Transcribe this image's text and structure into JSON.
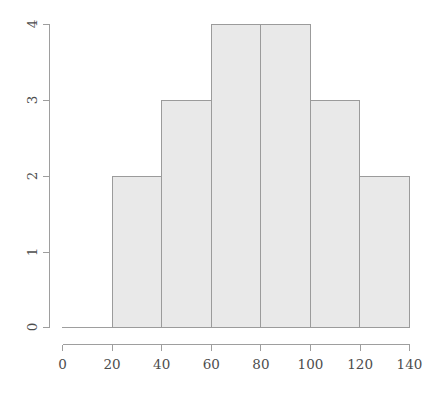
{
  "figure": {
    "name": "histogram-figure",
    "background_color": "#ffffff",
    "width": 438,
    "height": 399
  },
  "chart_data": {
    "type": "bar",
    "subtype": "histogram",
    "title": "",
    "subtitle": "",
    "xlabel": "",
    "ylabel": "",
    "categories": [
      "20-40",
      "40-60",
      "60-80",
      "80-100",
      "100-120",
      "120-140"
    ],
    "bin_edges": [
      20,
      40,
      60,
      80,
      100,
      120,
      140
    ],
    "bin_width": 20,
    "values": [
      2,
      3,
      4,
      4,
      3,
      2
    ],
    "x": [
      30,
      50,
      70,
      90,
      110,
      130
    ],
    "xlim": [
      0,
      140
    ],
    "ylim": [
      0,
      4
    ],
    "xticks": [
      0,
      20,
      40,
      60,
      80,
      100,
      120,
      140
    ],
    "xtick_labels": [
      "0",
      "20",
      "40",
      "60",
      "80",
      "100",
      "120",
      "140"
    ],
    "yticks": [
      0,
      1,
      2,
      3,
      4
    ],
    "ytick_labels": [
      "0",
      "1",
      "2",
      "3",
      "4"
    ],
    "grid": false,
    "legend": false,
    "legend_position": "none",
    "bar_fill_color": "#e9e9e9",
    "bar_border_color": "#9b9b9b",
    "axis_color": "#9e9e9e",
    "tick_label_color": "#4d4d4d"
  },
  "axes": {
    "x_axis_name": "x-axis",
    "y_axis_name": "y-axis",
    "x_tick_labels": [
      "0",
      "20",
      "40",
      "60",
      "80",
      "100",
      "120",
      "140"
    ],
    "y_tick_labels": [
      "0",
      "1",
      "2",
      "3",
      "4"
    ]
  },
  "bars": [
    {
      "label": "bin-20-40",
      "value": "2",
      "bin_start": "20",
      "bin_end": "40"
    },
    {
      "label": "bin-40-60",
      "value": "3",
      "bin_start": "40",
      "bin_end": "60"
    },
    {
      "label": "bin-60-80",
      "value": "4",
      "bin_start": "60",
      "bin_end": "80"
    },
    {
      "label": "bin-80-100",
      "value": "4",
      "bin_start": "80",
      "bin_end": "100"
    },
    {
      "label": "bin-100-120",
      "value": "3",
      "bin_start": "100",
      "bin_end": "120"
    },
    {
      "label": "bin-120-140",
      "value": "2",
      "bin_start": "120",
      "bin_end": "140"
    }
  ]
}
